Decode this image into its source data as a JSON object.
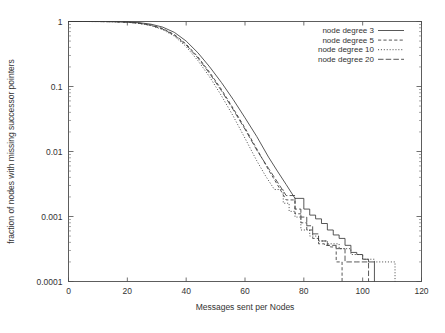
{
  "chart_data": {
    "type": "line",
    "title": "",
    "xlabel": "Messages sent per Nodes",
    "ylabel": "fraction of nodes with missing successor pointers",
    "xlim": [
      0,
      120
    ],
    "ylim": [
      0.0001,
      1
    ],
    "yscale": "log",
    "xscale": "linear",
    "grid": false,
    "legend_position": "top-right",
    "xticks": [
      "0",
      "20",
      "40",
      "60",
      "80",
      "100",
      "120"
    ],
    "xtick_values": [
      0,
      20,
      40,
      60,
      80,
      100,
      120
    ],
    "yticks": [
      "1",
      "0.1",
      "0.01",
      "0.001",
      "0.0001"
    ],
    "ytick_values": [
      1,
      0.1,
      0.01,
      0.001,
      0.0001
    ],
    "series": [
      {
        "name": "node degree 3",
        "style": "solid",
        "x": [
          0,
          5,
          10,
          15,
          20,
          24,
          28,
          32,
          36,
          40,
          44,
          48,
          52,
          56,
          60,
          64,
          68,
          71,
          74,
          77,
          80,
          82,
          84,
          86,
          88,
          90,
          92,
          94,
          96,
          98,
          100,
          102,
          104,
          104
        ],
        "y": [
          1.0,
          1.0,
          0.999,
          0.996,
          0.985,
          0.96,
          0.91,
          0.82,
          0.68,
          0.5,
          0.33,
          0.2,
          0.115,
          0.063,
          0.033,
          0.017,
          0.0082,
          0.005,
          0.0031,
          0.0019,
          0.0013,
          0.00105,
          0.00092,
          0.00078,
          0.00062,
          0.00052,
          0.00046,
          0.00036,
          0.00028,
          0.00026,
          0.00022,
          0.0002,
          0.0002,
          0.0001
        ]
      },
      {
        "name": "node degree 5",
        "style": "dashed",
        "x": [
          0,
          5,
          10,
          15,
          20,
          24,
          28,
          32,
          36,
          40,
          44,
          48,
          52,
          56,
          60,
          64,
          68,
          71,
          74,
          77,
          79,
          81,
          83,
          85,
          87,
          89,
          91,
          93,
          93
        ],
        "y": [
          1.0,
          1.0,
          0.999,
          0.994,
          0.978,
          0.945,
          0.885,
          0.78,
          0.63,
          0.45,
          0.285,
          0.165,
          0.09,
          0.046,
          0.023,
          0.011,
          0.0052,
          0.0031,
          0.0018,
          0.0011,
          0.0008,
          0.00062,
          0.00046,
          0.00038,
          0.00036,
          0.00034,
          0.0002,
          0.0002,
          0.0001
        ]
      },
      {
        "name": "node degree 10",
        "style": "dotted",
        "x": [
          0,
          5,
          10,
          15,
          20,
          24,
          28,
          32,
          36,
          40,
          44,
          48,
          52,
          56,
          60,
          64,
          67,
          70,
          73,
          75,
          77,
          79,
          82,
          85,
          88,
          92,
          96,
          100,
          104,
          108,
          111,
          111
        ],
        "y": [
          1.0,
          1.0,
          0.998,
          0.992,
          0.972,
          0.932,
          0.865,
          0.752,
          0.595,
          0.41,
          0.25,
          0.14,
          0.072,
          0.035,
          0.016,
          0.0072,
          0.0042,
          0.0026,
          0.0016,
          0.0012,
          0.00098,
          0.00062,
          0.0005,
          0.00042,
          0.00038,
          0.00032,
          0.00026,
          0.00022,
          0.0002,
          0.0002,
          0.0002,
          0.0001
        ]
      },
      {
        "name": "node degree 20",
        "style": "dash-dot",
        "x": [
          0,
          5,
          10,
          15,
          20,
          24,
          28,
          32,
          36,
          40,
          44,
          48,
          52,
          56,
          60,
          64,
          68,
          71,
          74,
          77,
          79,
          81,
          83,
          85,
          88,
          91,
          94,
          98,
          102,
          102
        ],
        "y": [
          1.0,
          1.0,
          0.999,
          0.993,
          0.975,
          0.938,
          0.875,
          0.765,
          0.615,
          0.435,
          0.275,
          0.158,
          0.086,
          0.044,
          0.022,
          0.0105,
          0.0055,
          0.0034,
          0.0021,
          0.0013,
          0.00098,
          0.00072,
          0.00054,
          0.00042,
          0.00036,
          0.00032,
          0.0002,
          0.0002,
          0.0002,
          0.0001
        ]
      }
    ]
  },
  "legend": {
    "items": [
      {
        "label": "node degree 3"
      },
      {
        "label": "node degree 5"
      },
      {
        "label": "node degree 10"
      },
      {
        "label": "node degree 20"
      }
    ]
  },
  "caption": {
    "ghost_text": ""
  }
}
